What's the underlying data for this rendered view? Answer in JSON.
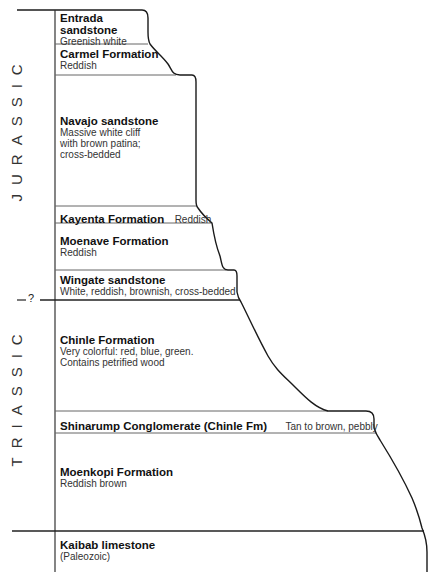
{
  "periods": [
    {
      "label": "JURASSIC"
    },
    {
      "label": "TRIASSIC"
    }
  ],
  "boundary_marker": "?",
  "layers": [
    {
      "name": "Entrada sandstone",
      "name_line2": "",
      "description": "Greenish white"
    },
    {
      "name": "Carmel Formation",
      "description": "Reddish"
    },
    {
      "name": "Navajo sandstone",
      "description_lines": [
        "Massive white cliff",
        "with brown patina;",
        "cross-bedded"
      ]
    },
    {
      "name": "Kayenta Formation",
      "description": "Reddish"
    },
    {
      "name": "Moenave Formation",
      "description": "Reddish"
    },
    {
      "name": "Wingate sandstone",
      "description": "White, reddish, brownish, cross-bedded"
    },
    {
      "name": "Chinle Formation",
      "description_lines": [
        "Very colorful: red, blue, green.",
        "Contains petrified wood"
      ]
    },
    {
      "name": "Shinarump Conglomerate (Chinle Fm)",
      "description": "Tan to brown, pebbly"
    },
    {
      "name": "Moenkopi Formation",
      "description": "Reddish brown"
    },
    {
      "name": "Kaibab limestone",
      "description": "(Paleozoic)"
    }
  ],
  "entrada_lines": [
    "Entrada",
    "sandstone"
  ],
  "colors": {
    "line": "#1a1a1a",
    "divider": "#555555",
    "background": "#ffffff"
  }
}
